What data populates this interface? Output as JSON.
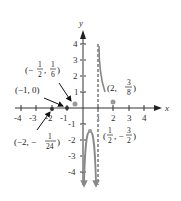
{
  "axes": {
    "x_label": "x",
    "y_label": "y",
    "x_ticks": [
      "-4",
      "-3",
      "-2",
      "-1",
      "1",
      "2",
      "3",
      "4"
    ],
    "y_ticks": [
      "4",
      "3",
      "2",
      "1",
      "-1",
      "-2",
      "-3",
      "-4"
    ]
  },
  "asymptotes": [
    {
      "type": "vertical",
      "x": 0,
      "style": "dashed"
    },
    {
      "type": "vertical",
      "x": 1,
      "style": "dashed"
    }
  ],
  "annotations": [
    {
      "id": "p1",
      "text": "(−1/2, 1/6)",
      "open": "(−",
      "num1": "1",
      "den1": "2",
      "sep": ",",
      "num2": "1",
      "den2": "6",
      "close": ")"
    },
    {
      "id": "p2",
      "text": "(−1, 0)"
    },
    {
      "id": "p3",
      "text": "(−2, −1/24)",
      "open": "(−2, −",
      "num": "1",
      "den": "24",
      "close": ")"
    },
    {
      "id": "p4",
      "text": "(2, 3/8)",
      "open": "(2,",
      "num": "3",
      "den": "8",
      "close": ")"
    },
    {
      "id": "p5",
      "text": "(1/2, −3/2)",
      "open": "(",
      "num1": "1",
      "den1": "2",
      "sep": ", −",
      "num2": "3",
      "den2": "2",
      "close": ")"
    }
  ],
  "colors": {
    "axis": "#333333",
    "curve": "#888888",
    "point": "#999999",
    "arrow": "#111111"
  }
}
